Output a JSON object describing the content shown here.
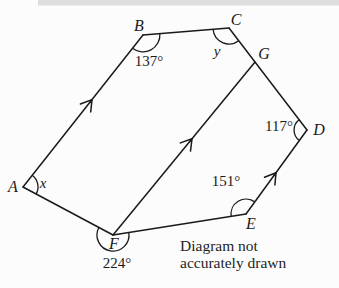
{
  "diagram": {
    "vertices": {
      "A": "A",
      "B": "B",
      "C": "C",
      "D": "D",
      "E": "E",
      "F": "F",
      "G": "G"
    },
    "angles": {
      "at_A": "x",
      "at_B": "137°",
      "at_C": "y",
      "at_D": "117°",
      "at_E": "151°",
      "at_F": "224°"
    },
    "note": {
      "line1": "Diagram not",
      "line2": "accurately drawn"
    },
    "colors": {
      "line": "#1a1a1a",
      "background": "#fcfcfc",
      "scan_band": "#d8d8d8"
    }
  }
}
